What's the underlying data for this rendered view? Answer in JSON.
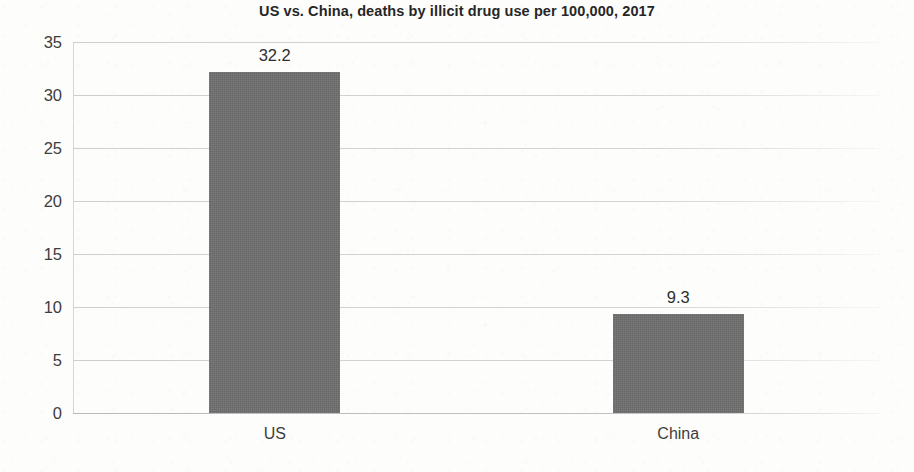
{
  "chart_data": {
    "type": "bar",
    "title": "US vs. China, deaths by illicit drug use per 100,000, 2017",
    "categories": [
      "US",
      "China"
    ],
    "values": [
      32.2,
      9.3
    ],
    "value_labels": [
      "32.2",
      "9.3"
    ],
    "xlabel": "",
    "ylabel": "",
    "ylim": [
      0,
      35
    ],
    "ytick_labels": [
      "35",
      "30",
      "25",
      "20",
      "15",
      "10",
      "5",
      "0"
    ],
    "ytick_values": [
      35,
      30,
      25,
      20,
      15,
      10,
      5,
      0
    ],
    "grid": true,
    "legend": false,
    "bar_color": "#6e6e6e",
    "gridline_color": "#d2d2d2",
    "title_color": "#262626",
    "tick_label_color": "#3d3d3d"
  }
}
